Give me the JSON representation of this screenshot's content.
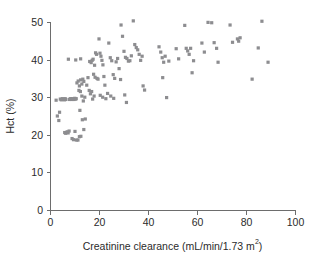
{
  "chart_data": {
    "type": "scatter",
    "title": "",
    "xlabel": "Creatinine clearance (mL/min/1.73 m2)",
    "xlabel_parts": {
      "main": "Creatinine clearance (mL/min/1.73 m",
      "superscript": "2",
      "tail": ")"
    },
    "ylabel": "Hct (%)",
    "xlim": [
      0,
      100
    ],
    "ylim": [
      0,
      50
    ],
    "xticks": [
      0,
      20,
      40,
      60,
      80,
      100
    ],
    "yticks": [
      0,
      10,
      20,
      30,
      40,
      50
    ],
    "grid": false,
    "legend": null,
    "marker": {
      "shape": "square",
      "color": "#8d8d90",
      "size_px": 3.2
    },
    "axis_color": "#6d6d6d",
    "text_color": "#2b2b2b",
    "background": "#ffffff",
    "n_points": 136,
    "points": [
      [
        2.5,
        29.2
      ],
      [
        3.0,
        25.0
      ],
      [
        3.6,
        23.8
      ],
      [
        3.9,
        26.0
      ],
      [
        4.2,
        29.5
      ],
      [
        4.6,
        29.3
      ],
      [
        5.0,
        29.6
      ],
      [
        5.3,
        29.4
      ],
      [
        5.6,
        29.5
      ],
      [
        5.9,
        29.3
      ],
      [
        6.2,
        29.6
      ],
      [
        6.5,
        29.4
      ],
      [
        6.0,
        20.6
      ],
      [
        6.4,
        20.4
      ],
      [
        7.0,
        20.8
      ],
      [
        7.4,
        20.5
      ],
      [
        7.8,
        21.0
      ],
      [
        8.0,
        29.4
      ],
      [
        8.3,
        29.6
      ],
      [
        8.6,
        29.5
      ],
      [
        8.9,
        29.4
      ],
      [
        9.2,
        29.6
      ],
      [
        9.5,
        29.5
      ],
      [
        9.8,
        29.4
      ],
      [
        10.1,
        29.7
      ],
      [
        10.4,
        29.5
      ],
      [
        10.7,
        29.6
      ],
      [
        9.0,
        19.0
      ],
      [
        9.6,
        18.7
      ],
      [
        10.2,
        20.9
      ],
      [
        10.8,
        18.6
      ],
      [
        11.4,
        18.6
      ],
      [
        12.0,
        19.5
      ],
      [
        12.6,
        19.6
      ],
      [
        11.0,
        33.8
      ],
      [
        11.5,
        34.3
      ],
      [
        12.0,
        33.0
      ],
      [
        12.5,
        34.6
      ],
      [
        13.0,
        33.5
      ],
      [
        13.4,
        34.8
      ],
      [
        13.8,
        34.2
      ],
      [
        11.8,
        31.8
      ],
      [
        12.4,
        31.5
      ],
      [
        13.0,
        30.3
      ],
      [
        13.6,
        29.0
      ],
      [
        14.2,
        30.0
      ],
      [
        12.2,
        26.5
      ],
      [
        13.2,
        24.0
      ],
      [
        13.8,
        21.4
      ],
      [
        14.4,
        24.2
      ],
      [
        7.5,
        40.1
      ],
      [
        10.5,
        39.9
      ],
      [
        12.5,
        40.2
      ],
      [
        15.0,
        33.2
      ],
      [
        15.5,
        35.2
      ],
      [
        16.0,
        31.8
      ],
      [
        16.5,
        30.9
      ],
      [
        17.0,
        31.5
      ],
      [
        17.4,
        29.5
      ],
      [
        18.0,
        30.3
      ],
      [
        16.2,
        39.5
      ],
      [
        16.8,
        39.2
      ],
      [
        17.2,
        39.8
      ],
      [
        17.6,
        40.1
      ],
      [
        18.2,
        38.5
      ],
      [
        18.6,
        41.8
      ],
      [
        19.0,
        41.4
      ],
      [
        17.8,
        36.1
      ],
      [
        18.4,
        35.3
      ],
      [
        19.2,
        35.0
      ],
      [
        19.6,
        34.8
      ],
      [
        20.0,
        45.5
      ],
      [
        20.4,
        41.7
      ],
      [
        20.8,
        40.9
      ],
      [
        21.2,
        39.8
      ],
      [
        21.6,
        38.6
      ],
      [
        22.0,
        35.5
      ],
      [
        22.4,
        33.2
      ],
      [
        20.5,
        30.5
      ],
      [
        21.5,
        30.0
      ],
      [
        22.8,
        29.6
      ],
      [
        23.5,
        31.0
      ],
      [
        24.0,
        44.4
      ],
      [
        24.6,
        40.5
      ],
      [
        25.2,
        39.7
      ],
      [
        25.8,
        36.0
      ],
      [
        26.4,
        35.0
      ],
      [
        24.8,
        30.3
      ],
      [
        26.0,
        29.7
      ],
      [
        27.0,
        39.4
      ],
      [
        27.6,
        40.3
      ],
      [
        28.2,
        37.6
      ],
      [
        28.8,
        34.7
      ],
      [
        29.0,
        49.2
      ],
      [
        29.6,
        46.2
      ],
      [
        30.2,
        42.2
      ],
      [
        30.8,
        40.6
      ],
      [
        31.4,
        40.3
      ],
      [
        32.0,
        39.6
      ],
      [
        30.5,
        30.6
      ],
      [
        31.2,
        28.6
      ],
      [
        32.6,
        39.7
      ],
      [
        33.2,
        41.0
      ],
      [
        34.0,
        50.3
      ],
      [
        34.6,
        44.0
      ],
      [
        35.2,
        43.2
      ],
      [
        35.8,
        42.6
      ],
      [
        36.4,
        41.4
      ],
      [
        37.0,
        39.8
      ],
      [
        37.6,
        40.9
      ],
      [
        38.0,
        33.0
      ],
      [
        38.6,
        31.9
      ],
      [
        44.5,
        43.4
      ],
      [
        45.2,
        42.0
      ],
      [
        45.8,
        40.5
      ],
      [
        46.4,
        39.3
      ],
      [
        46.0,
        35.2
      ],
      [
        47.0,
        40.9
      ],
      [
        47.6,
        29.9
      ],
      [
        48.5,
        39.6
      ],
      [
        51.5,
        42.9
      ],
      [
        52.5,
        40.2
      ],
      [
        55.0,
        49.1
      ],
      [
        55.6,
        43.0
      ],
      [
        56.2,
        42.3
      ],
      [
        56.8,
        41.4
      ],
      [
        57.4,
        43.0
      ],
      [
        58.0,
        36.5
      ],
      [
        58.6,
        39.7
      ],
      [
        62.0,
        44.4
      ],
      [
        63.0,
        42.0
      ],
      [
        64.5,
        49.9
      ],
      [
        66.0,
        49.8
      ],
      [
        67.0,
        44.5
      ],
      [
        68.0,
        43.0
      ],
      [
        68.6,
        39.3
      ],
      [
        73.5,
        49.2
      ],
      [
        74.5,
        44.6
      ],
      [
        76.5,
        45.5
      ],
      [
        77.0,
        44.9
      ],
      [
        77.6,
        45.8
      ],
      [
        82.5,
        34.8
      ],
      [
        85.0,
        43.1
      ],
      [
        86.5,
        50.2
      ],
      [
        89.0,
        39.3
      ]
    ]
  },
  "geometry": {
    "plot_left": 50,
    "plot_right": 295,
    "plot_bottom": 210,
    "plot_top": 22
  }
}
